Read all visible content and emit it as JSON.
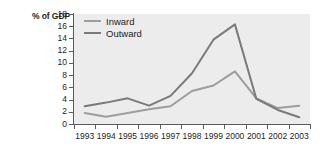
{
  "axis": {
    "y_unit_label": "% of GDP",
    "y_ticks": [
      "18",
      "16",
      "14",
      "12",
      "10",
      "8",
      "6",
      "4",
      "2",
      "0"
    ],
    "x_ticks": [
      "1993",
      "1994",
      "1995",
      "1996",
      "1997",
      "1998",
      "1999",
      "2000",
      "2001",
      "2002",
      "2003"
    ]
  },
  "legend": {
    "items": [
      {
        "label": "Inward",
        "color": "#9d9d9d"
      },
      {
        "label": "Outward",
        "color": "#7a7a7a"
      }
    ]
  },
  "colors": {
    "plot_background": "#ececec",
    "axis": "#5a5a5a",
    "text": "#231f20",
    "inward_line": "#9d9d9d",
    "outward_line": "#7a7a7a"
  },
  "chart_data": {
    "type": "line",
    "title": "",
    "xlabel": "",
    "ylabel": "% of GDP",
    "ylim": [
      0,
      18
    ],
    "ytick_step": 2,
    "grid": false,
    "legend_position": "top-left inside plot",
    "categories": [
      "1993",
      "1994",
      "1995",
      "1996",
      "1997",
      "1998",
      "1999",
      "2000",
      "2001",
      "2002",
      "2003"
    ],
    "series": [
      {
        "name": "Inward",
        "color": "#9d9d9d",
        "values": [
          1.8,
          1.2,
          1.8,
          2.4,
          2.9,
          5.4,
          6.3,
          8.6,
          4.2,
          2.6,
          3.0
        ]
      },
      {
        "name": "Outward",
        "color": "#7a7a7a",
        "values": [
          2.9,
          3.5,
          4.2,
          3.0,
          4.6,
          8.3,
          13.8,
          16.3,
          4.1,
          2.3,
          1.1
        ]
      }
    ]
  }
}
